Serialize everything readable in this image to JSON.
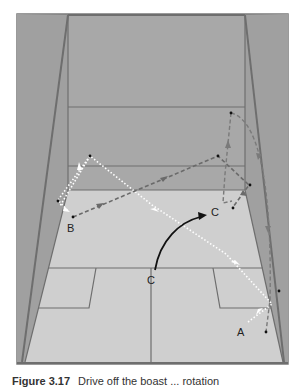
{
  "figure": {
    "type": "squash-court-shot-diagram",
    "labels": {
      "a": "A",
      "b": "B",
      "c_start": "C",
      "c_end": "C"
    },
    "colors": {
      "back_wall": "#a6a6a6",
      "side_wall": "#9a9a9a",
      "floor": "#cfcfcf",
      "court_lines": "#6e6e6e",
      "trajectory_white": "#ffffff",
      "trajectory_dashed": "#6a6a6a",
      "arrow_black": "#111111"
    }
  },
  "caption": {
    "number": "Figure 3.17",
    "text": "Drive off the boast ... rotation"
  }
}
